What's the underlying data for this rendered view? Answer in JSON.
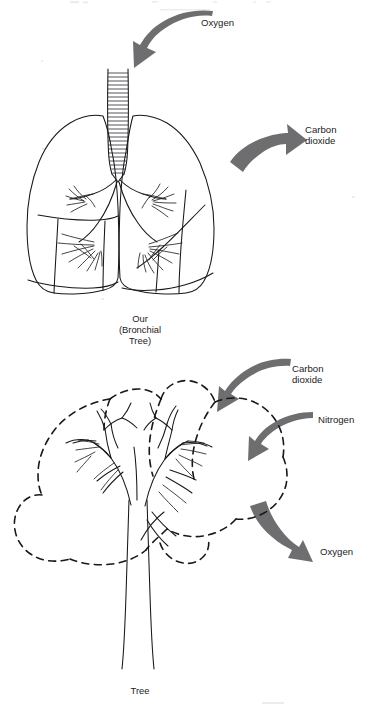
{
  "figure": {
    "background_color": "#ffffff",
    "ink_color": "#17171a",
    "arrow_color": "#6e6e71"
  },
  "panels": [
    {
      "id": "lungs",
      "name": "Our (Bronchial Tree)",
      "caption_lines": [
        "Our",
        "(Bronchial",
        "Tree)"
      ],
      "arrows": [
        {
          "id": "oxygen-in",
          "label": "Oxygen",
          "direction": "down-left",
          "label_lines": [
            "Oxygen"
          ]
        },
        {
          "id": "carbon-dioxide-out",
          "label": "Carbon dioxide",
          "direction": "up-right",
          "label_lines": [
            "Carbon",
            "dioxide"
          ]
        }
      ]
    },
    {
      "id": "tree",
      "name": "Tree",
      "caption_lines": [
        "Tree"
      ],
      "arrows": [
        {
          "id": "carbon-dioxide-in",
          "label": "Carbon dioxide",
          "direction": "down-left",
          "label_lines": [
            "Carbon",
            "dioxide"
          ]
        },
        {
          "id": "nitrogen-in",
          "label": "Nitrogen",
          "direction": "down-left",
          "label_lines": [
            "Nitrogen"
          ]
        },
        {
          "id": "oxygen-out",
          "label": "Oxygen",
          "direction": "down-right",
          "label_lines": [
            "Oxygen"
          ]
        }
      ]
    }
  ],
  "labels": {
    "oxygen_top": "Oxygen",
    "carbon_top_line1": "Carbon",
    "carbon_top_line2": "dioxide",
    "lungs_caption_line1": "Our",
    "lungs_caption_line2": "(Bronchial",
    "lungs_caption_line3": "Tree)",
    "carbon_tree_line1": "Carbon",
    "carbon_tree_line2": "dioxide",
    "nitrogen_tree": "Nitrogen",
    "oxygen_tree": "Oxygen",
    "tree_caption": "Tree"
  }
}
